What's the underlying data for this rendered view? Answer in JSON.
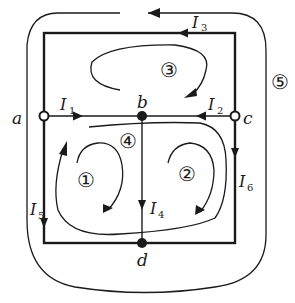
{
  "diagram": {
    "type": "circuit-loop-diagram",
    "colors": {
      "wire": "#1a1a1a",
      "background": "#ffffff"
    },
    "nodes": {
      "a": {
        "label": "a",
        "style": "open"
      },
      "b": {
        "label": "b",
        "style": "filled"
      },
      "c": {
        "label": "c",
        "style": "open"
      },
      "d": {
        "label": "d",
        "style": "filled"
      }
    },
    "currents": {
      "I1": {
        "main": "I",
        "sub": "1",
        "branch": "a→b"
      },
      "I2": {
        "main": "I",
        "sub": "2",
        "branch": "c→b"
      },
      "I3": {
        "main": "I",
        "sub": "3",
        "branch": "top wire, right→left"
      },
      "I4": {
        "main": "I",
        "sub": "4",
        "branch": "b→d"
      },
      "I5": {
        "main": "I",
        "sub": "5",
        "branch": "a→d (left wire, down)"
      },
      "I6": {
        "main": "I",
        "sub": "6",
        "branch": "c→d (right wire, down)"
      }
    },
    "loops": {
      "l1": {
        "label": "①",
        "direction": "clockwise"
      },
      "l2": {
        "label": "②",
        "direction": "clockwise"
      },
      "l3": {
        "label": "③",
        "direction": "clockwise"
      },
      "l4": {
        "label": "④",
        "direction": "counterclockwise"
      },
      "l5": {
        "label": "⑤",
        "direction": "counterclockwise"
      }
    }
  }
}
